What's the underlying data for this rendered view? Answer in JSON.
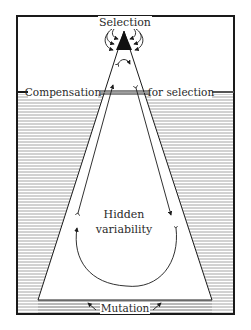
{
  "diagram": {
    "labels": {
      "top": "Selection",
      "band_left": "Compensation",
      "band_right": "for selection",
      "center_line1": "Hidden",
      "center_line2": "variability",
      "bottom": "Mutation"
    },
    "colors": {
      "ink": "#1a1a1a",
      "hatch": "#9a9a9a",
      "background": "#ffffff"
    }
  }
}
